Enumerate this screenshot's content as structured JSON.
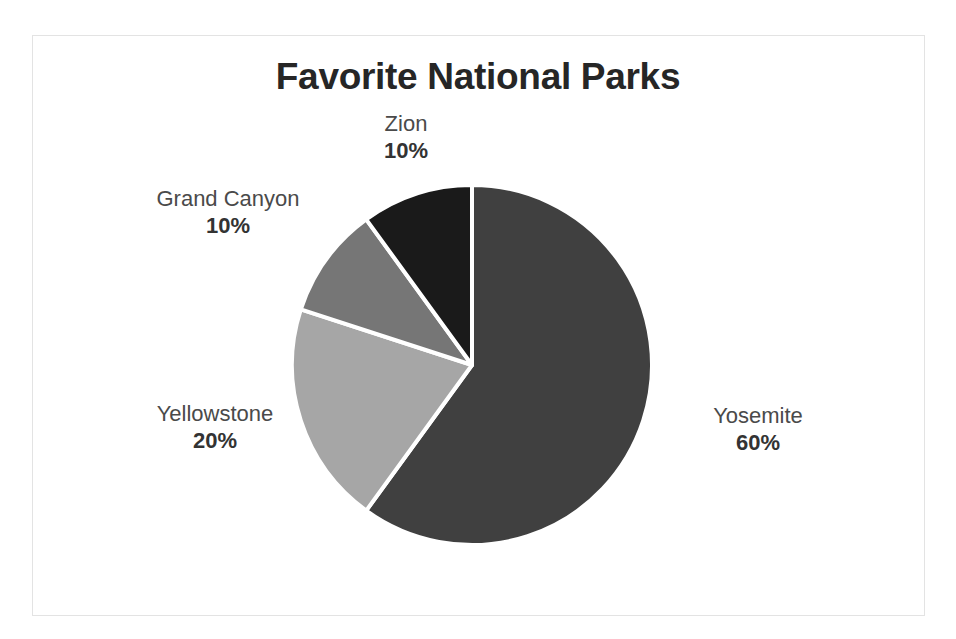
{
  "chart_data": {
    "type": "pie",
    "title": "Favorite National Parks",
    "categories": [
      "Yosemite",
      "Yellowstone",
      "Grand Canyon",
      "Zion"
    ],
    "values": [
      60,
      20,
      10,
      10
    ],
    "value_labels": [
      "60%",
      "20%",
      "10%",
      "10%"
    ],
    "unit": "%",
    "start_angle_deg": 0,
    "direction": "clockwise",
    "legend": "none",
    "labels_position": "outside",
    "grid": false,
    "slice_colors": [
      "#404040",
      "#a6a6a6",
      "#767676",
      "#1a1a1a"
    ],
    "slice_border_color": "#ffffff"
  },
  "chart": {
    "title": "Favorite National Parks",
    "frame_border_color": "#e3e3e3",
    "background": "#ffffff",
    "slices": [
      {
        "name": "Yosemite",
        "category_label": "Yosemite",
        "percent_label": "60%",
        "value": 60,
        "color": "#404040"
      },
      {
        "name": "Yellowstone",
        "category_label": "Yellowstone",
        "percent_label": "20%",
        "value": 20,
        "color": "#a6a6a6"
      },
      {
        "name": "Grand Canyon",
        "category_label": "Grand Canyon",
        "percent_label": "10%",
        "value": 10,
        "color": "#767676"
      },
      {
        "name": "Zion",
        "category_label": "Zion",
        "percent_label": "10%",
        "value": 10,
        "color": "#1a1a1a"
      }
    ]
  }
}
